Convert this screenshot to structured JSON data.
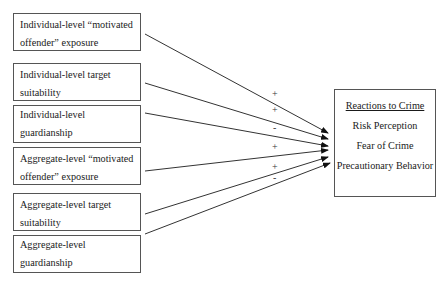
{
  "diagram": {
    "inputs": [
      {
        "line1": "Individual-level “motivated",
        "line2": "offender” exposure",
        "sign": "+"
      },
      {
        "line1": "Individual-level target",
        "line2": "suitability",
        "sign": "+"
      },
      {
        "line1": "Individual-level guardianship",
        "line2": "",
        "sign": "-"
      },
      {
        "line1": "Aggregate-level “motivated",
        "line2": "offender” exposure",
        "sign": "+"
      },
      {
        "line1": "Aggregate-level target",
        "line2": "suitability",
        "sign": "+"
      },
      {
        "line1": "Aggregate-level guardianship",
        "line2": "",
        "sign": "-"
      }
    ],
    "outcome": {
      "title": "Reactions to Crime",
      "items": [
        "Risk Perception",
        "Fear of Crime",
        "Precautionary Behavior"
      ]
    }
  }
}
